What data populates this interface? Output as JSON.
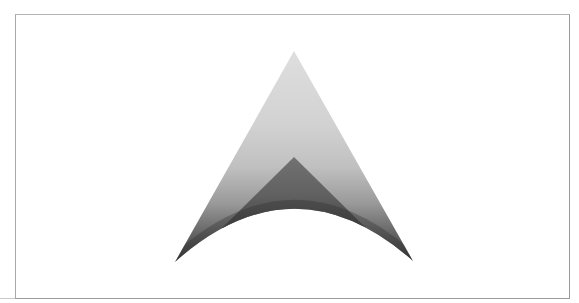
{
  "figure": {
    "colors": {
      "background": "#ffffff",
      "frame": "#a8a8a8",
      "outer_gradient_top": "#dcdcdc",
      "outer_gradient_mid": "#c2c2c2",
      "outer_gradient_bottom": "#3a3a3a",
      "inner_top": "#6e6e6e",
      "inner_bottom": "#4e4e4e"
    },
    "geometry": {
      "frame": {
        "left": 15,
        "top": 14,
        "right": 569,
        "bottom": 298
      },
      "outer_apex": [
        294,
        51
      ],
      "left_tip": [
        175,
        262
      ],
      "right_tip": [
        413,
        261
      ],
      "arc_peak": [
        294,
        209
      ],
      "inner_apex": [
        294,
        157
      ]
    }
  }
}
